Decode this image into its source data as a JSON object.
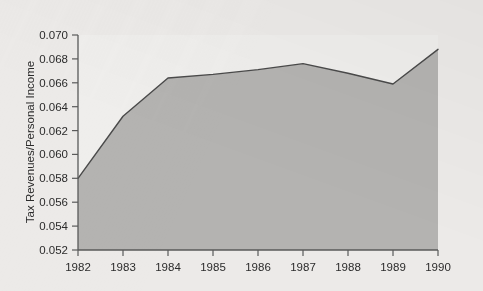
{
  "chart_data": {
    "type": "area",
    "title": "",
    "subtitle": "",
    "xlabel": "",
    "ylabel": "Tax Revenues/Personal Income",
    "categories": [
      "1982",
      "1983",
      "1984",
      "1985",
      "1986",
      "1987",
      "1988",
      "1989",
      "1990"
    ],
    "x": [
      1982,
      1983,
      1984,
      1985,
      1986,
      1987,
      1988,
      1989,
      1990
    ],
    "values": [
      0.058,
      0.0632,
      0.0664,
      0.0667,
      0.0671,
      0.0676,
      0.0668,
      0.0659,
      0.0688
    ],
    "series": [
      {
        "name": "Tax Revenues/Personal Income",
        "values": [
          0.058,
          0.0632,
          0.0664,
          0.0667,
          0.0671,
          0.0676,
          0.0668,
          0.0659,
          0.0688
        ]
      }
    ],
    "ylim": [
      0.052,
      0.07
    ],
    "xlim": [
      1982,
      1990
    ],
    "y_ticks": [
      0.052,
      0.054,
      0.056,
      0.058,
      0.06,
      0.062,
      0.064,
      0.066,
      0.068,
      0.07
    ],
    "y_tick_labels": [
      "0.052",
      "0.054",
      "0.056",
      "0.058",
      "0.060",
      "0.062",
      "0.064",
      "0.066",
      "0.068",
      "0.070"
    ],
    "x_ticks": [
      1982,
      1983,
      1984,
      1985,
      1986,
      1987,
      1988,
      1989,
      1990
    ],
    "x_tick_labels": [
      "1982",
      "1983",
      "1984",
      "1985",
      "1986",
      "1987",
      "1988",
      "1989",
      "1990"
    ],
    "grid": false,
    "legend": false,
    "legend_position": "none",
    "annotations": []
  },
  "colors": {
    "page_background": "#e9e8e6",
    "plot_background_upper": "#eeedeb",
    "area_fill": "#b4b3b1",
    "line": "#4a4a4a",
    "axis": "#5a5a5a",
    "text": "#2b2b2b"
  },
  "axis": {
    "y_title": "Tax Revenues/Personal Income",
    "y_labels": [
      "0.070",
      "0.068",
      "0.066",
      "0.064",
      "0.062",
      "0.060",
      "0.058",
      "0.056",
      "0.054",
      "0.052"
    ],
    "x_labels": [
      "1982",
      "1983",
      "1984",
      "1985",
      "1986",
      "1987",
      "1988",
      "1989",
      "1990"
    ]
  }
}
